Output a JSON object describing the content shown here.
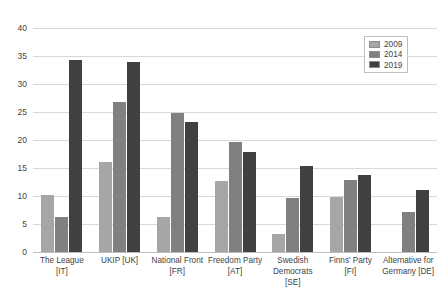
{
  "chart_data": {
    "type": "bar",
    "title": "",
    "subtitle": "",
    "xlabel": "",
    "ylabel": "",
    "ylim": [
      0,
      40
    ],
    "yticks": [
      0,
      5,
      10,
      15,
      20,
      25,
      30,
      35,
      40
    ],
    "grid": true,
    "legend_position": "top-right",
    "categories": [
      "The League [IT]",
      "UKIP [UK]",
      "National Front [FR]",
      "Freedom Party [AT]",
      "Swedish Democrats [SE]",
      "Finns' Party [FI]",
      "Alternative for Germany  [DE]"
    ],
    "series": [
      {
        "name": "2009",
        "color": "#a6a6a6",
        "values": [
          10.2,
          16.1,
          6.3,
          12.7,
          3.3,
          9.8,
          null
        ]
      },
      {
        "name": "2014",
        "color": "#808080",
        "values": [
          6.2,
          26.8,
          24.9,
          19.7,
          9.7,
          12.9,
          7.1
        ]
      },
      {
        "name": "2019",
        "color": "#404040",
        "values": [
          34.3,
          34.0,
          23.3,
          17.9,
          15.4,
          13.8,
          11.0
        ]
      }
    ]
  },
  "legend": {
    "entries": [
      {
        "label": "2009"
      },
      {
        "label": "2014"
      },
      {
        "label": "2019"
      }
    ]
  }
}
